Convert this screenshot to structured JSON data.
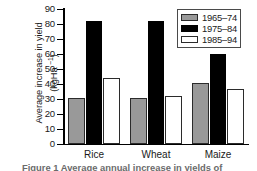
{
  "chart_data": {
    "type": "bar",
    "title": "",
    "xlabel": "",
    "ylabel": "Average increase in yield (kgHa −1)",
    "ylabel_line1": "Average increase in yield",
    "ylabel_line2_prefix": "(kgHa ",
    "ylabel_line2_sup": "−1",
    "ylabel_line2_suffix": ")",
    "categories": [
      "Rice",
      "Wheat",
      "Maize"
    ],
    "series": [
      {
        "name": "1965–74",
        "color": "#999999",
        "values": [
          31,
          31,
          41
        ]
      },
      {
        "name": "1975–84",
        "color": "#000000",
        "values": [
          82,
          82,
          60
        ]
      },
      {
        "name": "1985–94",
        "color": "#ffffff",
        "values": [
          44,
          32,
          37
        ]
      }
    ],
    "ylim": [
      0,
      90
    ],
    "yticks": [
      0,
      10,
      20,
      30,
      40,
      50,
      60,
      70,
      80,
      90
    ],
    "ytick_labels": [
      "0",
      "10",
      "20",
      "30",
      "40",
      "50",
      "60",
      "70",
      "80",
      "90"
    ],
    "grid": false,
    "legend_position": "top-right"
  },
  "legend": {
    "entries": [
      {
        "label": "1965–74",
        "swatch": "gray-swatch"
      },
      {
        "label": "1975–84",
        "swatch": "black-swatch"
      },
      {
        "label": "1985–94",
        "swatch": "white-swatch"
      }
    ]
  },
  "caption": {
    "text": "Figure 1  Average annual increase in yields of"
  }
}
